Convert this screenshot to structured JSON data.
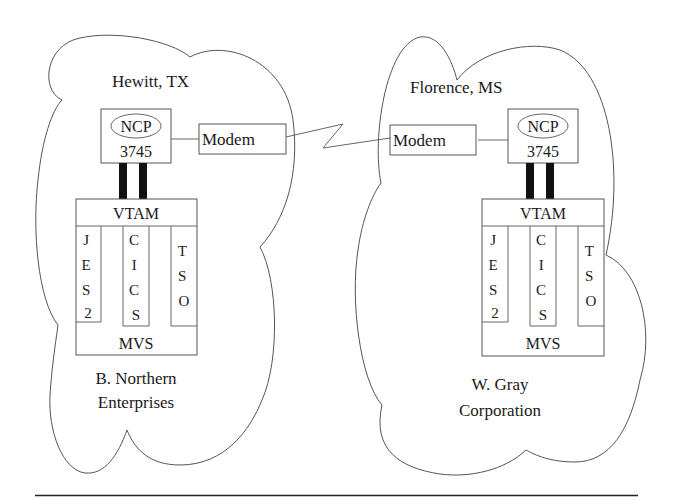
{
  "diagram": {
    "sites": [
      {
        "id": "left",
        "location": "Hewitt, TX",
        "organization_line1": "B. Northern",
        "organization_line2": "Enterprises",
        "ncp": {
          "label": "NCP",
          "model": "3745"
        },
        "modem": "Modem",
        "host": {
          "top": "VTAM",
          "bottom": "MVS",
          "subsystems": [
            {
              "name": "JES2",
              "letters": [
                "J",
                "E",
                "S",
                "2"
              ]
            },
            {
              "name": "CICS",
              "letters": [
                "C",
                "I",
                "C",
                "S"
              ]
            },
            {
              "name": "TSO",
              "letters": [
                "T",
                "S",
                "O"
              ]
            }
          ]
        }
      },
      {
        "id": "right",
        "location": "Florence, MS",
        "organization_line1": "W. Gray",
        "organization_line2": "Corporation",
        "ncp": {
          "label": "NCP",
          "model": "3745"
        },
        "modem": "Modem",
        "host": {
          "top": "VTAM",
          "bottom": "MVS",
          "subsystems": [
            {
              "name": "JES2",
              "letters": [
                "J",
                "E",
                "S",
                "2"
              ]
            },
            {
              "name": "CICS",
              "letters": [
                "C",
                "I",
                "C",
                "S"
              ]
            },
            {
              "name": "TSO",
              "letters": [
                "T",
                "S",
                "O"
              ]
            }
          ]
        }
      }
    ],
    "link": {
      "type": "lightning-bolt",
      "between": "modems"
    },
    "colors": {
      "line": "#555555",
      "text": "#1a1a1a",
      "channel": "#111111",
      "background": "#ffffff"
    }
  }
}
